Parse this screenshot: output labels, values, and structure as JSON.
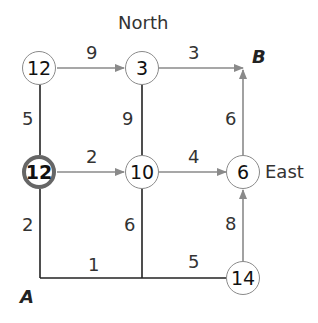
{
  "directions": {
    "north": "North",
    "east": "East"
  },
  "endpoints": {
    "start": "A",
    "end": "B"
  },
  "nodes": [
    {
      "id": "n-top-left",
      "value": "12"
    },
    {
      "id": "n-top-mid",
      "value": "3"
    },
    {
      "id": "n-mid-left",
      "value": "12",
      "highlighted": true
    },
    {
      "id": "n-mid-mid",
      "value": "10"
    },
    {
      "id": "n-mid-right",
      "value": "6"
    },
    {
      "id": "n-bot-right",
      "value": "14"
    }
  ],
  "edges": {
    "top_left_to_top_mid": "9",
    "top_mid_to_B": "3",
    "top_left_to_mid_left": "5",
    "top_mid_to_mid_mid": "9",
    "mid_right_to_B": "6",
    "mid_left_to_mid_mid": "2",
    "mid_mid_to_mid_right": "4",
    "A_to_mid_left": "2",
    "mid_mid_to_bottom": "6",
    "bot_right_to_mid_right": "8",
    "A_to_bottom_mid": "1",
    "bottom_mid_to_bot_right": "5"
  },
  "colors": {
    "arrow": "#8a8a8a",
    "line": "#222222",
    "bold_ring": "#666666"
  }
}
